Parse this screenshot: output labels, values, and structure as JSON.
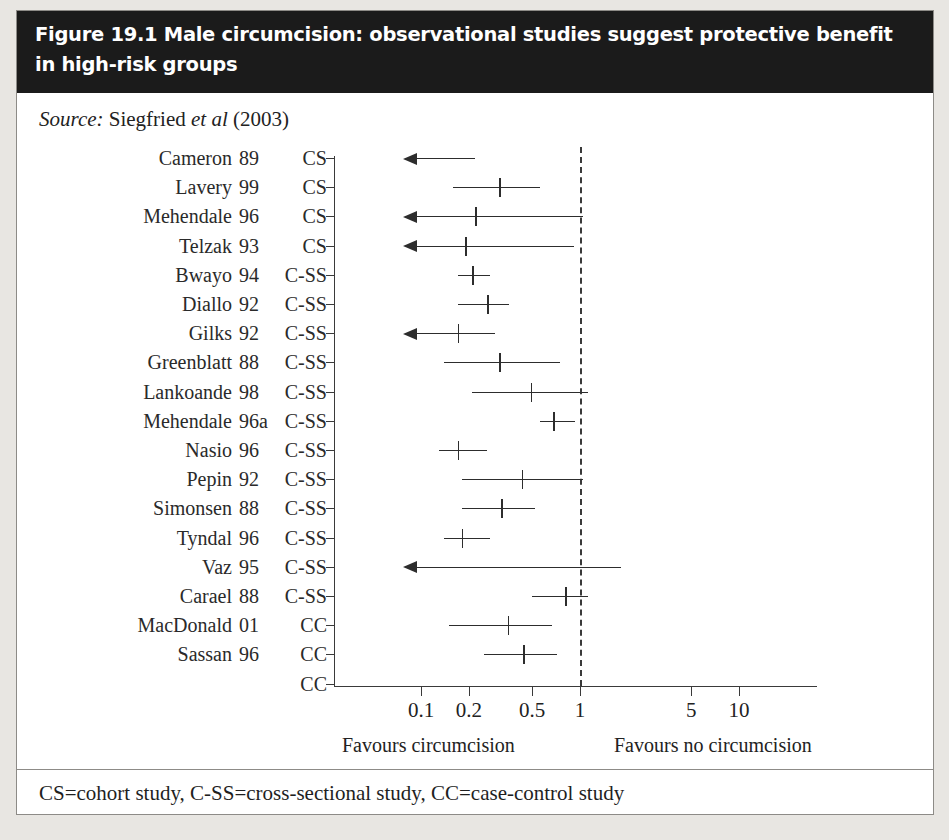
{
  "figure": {
    "title": "Figure 19.1 Male circumcision: observational studies suggest protective benefit in high-risk groups",
    "source_prefix": "Source:",
    "source_name": "Siegfried",
    "source_etal": "et al",
    "source_year": "(2003)",
    "footer": "CS=cohort study, C-SS=cross-sectional study, CC=case-control study",
    "favours_left": "Favours circumcision",
    "favours_right": "Favours no circumcision"
  },
  "colors": {
    "header_bg": "#1b1b1b",
    "header_text": "#ffffff",
    "box_bg": "#ffffff",
    "page_bg": "#e8e6e2",
    "ink": "#2d2d2d",
    "rule": "#8d8b87"
  },
  "chart_data": {
    "type": "forest",
    "title": "Figure 19.1 Male circumcision: observational studies suggest protective benefit in high-risk groups",
    "xlabel": "Relative risk (log scale)",
    "ylabel": "",
    "scale": "log10",
    "xlim": [
      0.07,
      20
    ],
    "null_value": 1,
    "grid": false,
    "tick_values": [
      0.1,
      0.2,
      0.5,
      1,
      5,
      10
    ],
    "tick_labels": [
      "0.1",
      "0.2",
      "0.5",
      "1",
      "5",
      "10"
    ],
    "columns": [
      "study",
      "year",
      "design"
    ],
    "legend_note": "CS=cohort study, C-SS=cross-sectional study, CC=case-control study",
    "rows": [
      {
        "study": "Cameron",
        "year": "89",
        "design": "CS",
        "estimate": null,
        "ci_low": null,
        "ci_high": 0.22,
        "arrow_left": true
      },
      {
        "study": "Lavery",
        "year": "99",
        "design": "CS",
        "estimate": 0.31,
        "ci_low": 0.16,
        "ci_high": 0.56,
        "arrow_left": false
      },
      {
        "study": "Mehendale",
        "year": "96",
        "design": "CS",
        "estimate": 0.22,
        "ci_low": null,
        "ci_high": 1.05,
        "arrow_left": true
      },
      {
        "study": "Telzak",
        "year": "93",
        "design": "CS",
        "estimate": 0.19,
        "ci_low": null,
        "ci_high": 0.92,
        "arrow_left": true
      },
      {
        "study": "Bwayo",
        "year": "94",
        "design": "C-SS",
        "estimate": 0.21,
        "ci_low": 0.17,
        "ci_high": 0.27,
        "arrow_left": false
      },
      {
        "study": "Diallo",
        "year": "92",
        "design": "C-SS",
        "estimate": 0.26,
        "ci_low": 0.17,
        "ci_high": 0.36,
        "arrow_left": false
      },
      {
        "study": "Gilks",
        "year": "92",
        "design": "C-SS",
        "estimate": 0.17,
        "ci_low": null,
        "ci_high": 0.29,
        "arrow_left": true
      },
      {
        "study": "Greenblatt",
        "year": "88",
        "design": "C-SS",
        "estimate": 0.31,
        "ci_low": 0.14,
        "ci_high": 0.75,
        "arrow_left": false
      },
      {
        "study": "Lankoande",
        "year": "98",
        "design": "C-SS",
        "estimate": 0.49,
        "ci_low": 0.21,
        "ci_high": 1.12,
        "arrow_left": false
      },
      {
        "study": "Mehendale",
        "year": "96a",
        "design": "C-SS",
        "estimate": 0.68,
        "ci_low": 0.56,
        "ci_high": 0.93,
        "arrow_left": false
      },
      {
        "study": "Nasio",
        "year": "96",
        "design": "C-SS",
        "estimate": 0.17,
        "ci_low": 0.13,
        "ci_high": 0.26,
        "arrow_left": false
      },
      {
        "study": "Pepin",
        "year": "92",
        "design": "C-SS",
        "estimate": 0.43,
        "ci_low": 0.18,
        "ci_high": 1.05,
        "arrow_left": false
      },
      {
        "study": "Simonsen",
        "year": "88",
        "design": "C-SS",
        "estimate": 0.32,
        "ci_low": 0.18,
        "ci_high": 0.52,
        "arrow_left": false
      },
      {
        "study": "Tyndal",
        "year": "96",
        "design": "C-SS",
        "estimate": 0.18,
        "ci_low": 0.14,
        "ci_high": 0.27,
        "arrow_left": false
      },
      {
        "study": "Vaz",
        "year": "95",
        "design": "C-SS",
        "estimate": null,
        "ci_low": null,
        "ci_high": 1.8,
        "arrow_left": true
      },
      {
        "study": "Carael",
        "year": "88",
        "design": "C-SS",
        "estimate": 0.81,
        "ci_low": 0.5,
        "ci_high": 1.12,
        "arrow_left": false
      },
      {
        "study": "MacDonald",
        "year": "01",
        "design": "CC",
        "estimate": 0.35,
        "ci_low": 0.15,
        "ci_high": 0.67,
        "arrow_left": false
      },
      {
        "study": "Sassan",
        "year": "96",
        "design": "CC",
        "estimate": 0.44,
        "ci_low": 0.25,
        "ci_high": 0.72,
        "arrow_left": false
      },
      {
        "study": "",
        "year": "",
        "design": "CC",
        "estimate": null,
        "ci_low": null,
        "ci_high": null,
        "arrow_left": false
      }
    ]
  }
}
